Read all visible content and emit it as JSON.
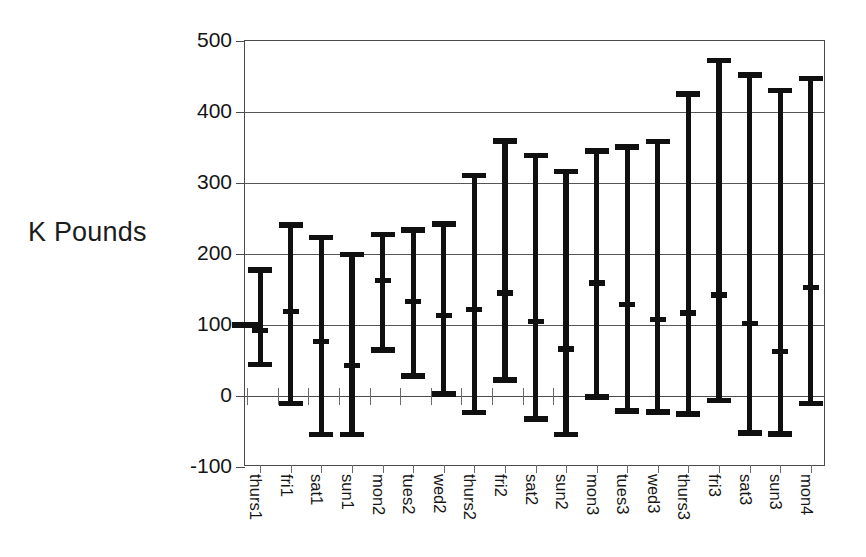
{
  "chart_data": {
    "type": "bar",
    "subtype": "error-bar-range",
    "title": "",
    "xlabel": "",
    "ylabel": "K Pounds",
    "ylim": [
      -100,
      500
    ],
    "yticks": [
      -100,
      0,
      100,
      200,
      300,
      400,
      500
    ],
    "ytick_labels": [
      "-100",
      "0",
      "100",
      "200",
      "300",
      "400",
      "500"
    ],
    "grid": true,
    "grid_axis": "y",
    "legend": "none",
    "categories": [
      "thurs1",
      "fri1",
      "sat1",
      "sun1",
      "mon2",
      "tues2",
      "wed2",
      "thurs2",
      "fri2",
      "sat2",
      "sun2",
      "mon3",
      "tues3",
      "wed3",
      "thurs3",
      "fri3",
      "sat3",
      "sun3",
      "mon4"
    ],
    "series": [
      {
        "name": "upper",
        "values": [
          180,
          243,
          226,
          202,
          230,
          236,
          245,
          313,
          362,
          341,
          319,
          348,
          353,
          361,
          428,
          475,
          455,
          433,
          450
        ]
      },
      {
        "name": "mid",
        "values": [
          92,
          119,
          77,
          43,
          163,
          133,
          113,
          122,
          145,
          105,
          66,
          159,
          129,
          108,
          117,
          142,
          102,
          63,
          153
        ]
      },
      {
        "name": "lower",
        "values": [
          42,
          -13,
          -57,
          -57,
          62,
          26,
          0,
          -26,
          20,
          -35,
          -57,
          -4,
          -24,
          -25,
          -28,
          -9,
          -55,
          -56,
          -13
        ]
      }
    ],
    "axis_marker": {
      "label": "baseline-marker",
      "value": 100
    },
    "colors": {
      "bars": "#101010",
      "grid": "#575757",
      "axis": "#4a4a4a",
      "text": "#141414",
      "background": "#ffffff"
    }
  },
  "labels": {
    "ylabel_text": "K Pounds"
  }
}
